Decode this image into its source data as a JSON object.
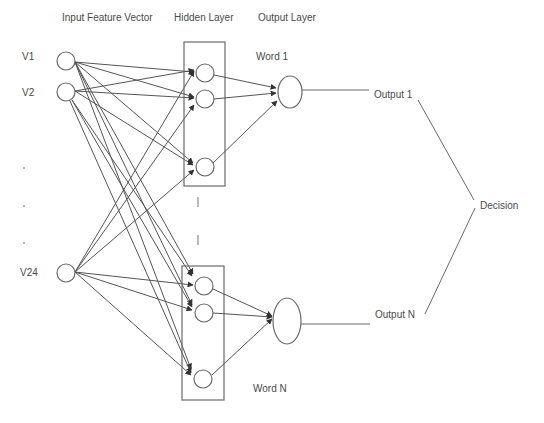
{
  "headers": {
    "input": "Input Feature Vector",
    "hidden": "Hidden Layer",
    "output": "Output Layer"
  },
  "inputs": [
    {
      "label": "V1"
    },
    {
      "label": "V2"
    },
    {
      "label": "V24"
    }
  ],
  "ellipsis_dots": [
    ".",
    ".",
    "."
  ],
  "outputs": [
    {
      "word": "Word 1",
      "label": "Output 1"
    },
    {
      "word": "Word N",
      "label": "Output N"
    }
  ],
  "decision": {
    "label": "Decision"
  },
  "colors": {
    "stroke": "#6a6a6a",
    "text": "#4a4a4a",
    "background": "#ffffff"
  }
}
